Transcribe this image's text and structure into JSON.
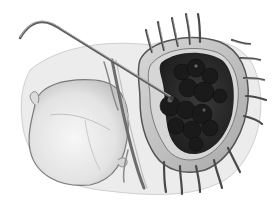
{
  "image": {
    "kind": "surgical-illustration",
    "style": "grayscale pencil drawing",
    "width": 280,
    "height": 201,
    "colors": {
      "background": "#ffffff",
      "tissue_light": "#e6e6e6",
      "tissue_mid": "#bdbdbd",
      "cavity_dark": "#2f2f2f",
      "mass_dark": "#1a1a1a",
      "outline": "#555555",
      "instrument": "#6a6a6a"
    },
    "elements": [
      {
        "name": "retracted-flap",
        "description": "large pale oval membrane on the left"
      },
      {
        "name": "opened-cavity",
        "description": "dark open cavity ringed by a rim"
      },
      {
        "name": "dark-mass",
        "description": "clustered dark lobulated mass inside cavity"
      },
      {
        "name": "retraction-sutures",
        "description": "many curved stay sutures around the rim"
      },
      {
        "name": "probe-instrument",
        "description": "long bent metal probe entering from top-left"
      },
      {
        "name": "vessel-bundle",
        "description": "vertical vessel strands between flap and cavity"
      }
    ]
  }
}
